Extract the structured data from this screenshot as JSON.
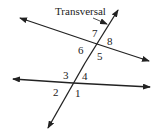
{
  "diagram": {
    "title_label": "Transversal",
    "angles": [
      {
        "id": "1",
        "label": "1"
      },
      {
        "id": "2",
        "label": "2"
      },
      {
        "id": "3",
        "label": "3"
      },
      {
        "id": "4",
        "label": "4"
      },
      {
        "id": "5",
        "label": "5"
      },
      {
        "id": "6",
        "label": "6"
      },
      {
        "id": "7",
        "label": "7"
      },
      {
        "id": "8",
        "label": "8"
      }
    ],
    "colors": {
      "line": "#222222",
      "background": "#ffffff"
    }
  }
}
